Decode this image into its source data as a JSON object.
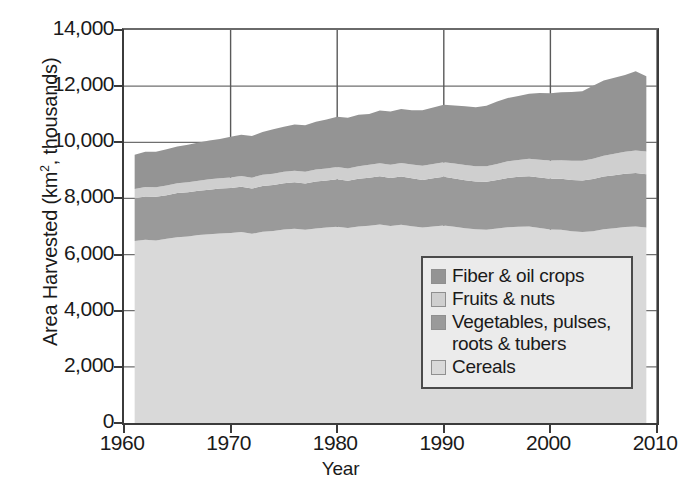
{
  "chart_data": {
    "type": "area",
    "title": "",
    "xlabel": "Year",
    "ylabel": "Area Harvested (km2, thousands)",
    "ylabel_parts": {
      "pre": "Area Harvested (km",
      "sup": "2",
      "post": ", thousands)"
    },
    "xlim": [
      1960,
      2010
    ],
    "ylim": [
      0,
      14000
    ],
    "ytick_labels": [
      "14,000",
      "12,000",
      "10,000",
      "8,000",
      "6,000",
      "4,000",
      "2,000",
      "0"
    ],
    "ytick_values": [
      14000,
      12000,
      10000,
      8000,
      6000,
      4000,
      2000,
      0
    ],
    "xtick_labels": [
      "1960",
      "1970",
      "1980",
      "1990",
      "2000",
      "2010"
    ],
    "xtick_values": [
      1960,
      1970,
      1980,
      1990,
      2000,
      2010
    ],
    "grid": "vertical and horizontal gridlines at major ticks",
    "legend_position": "inside lower-right of plot area",
    "stacking_order_bottom_to_top": [
      "Cereals",
      "Vegetables, pulses, roots & tubers",
      "Fruits & nuts",
      "Fiber & oil crops"
    ],
    "x": [
      1961,
      1962,
      1963,
      1964,
      1965,
      1966,
      1967,
      1968,
      1969,
      1970,
      1971,
      1972,
      1973,
      1974,
      1975,
      1976,
      1977,
      1978,
      1979,
      1980,
      1981,
      1982,
      1983,
      1984,
      1985,
      1986,
      1987,
      1988,
      1989,
      1990,
      1991,
      1992,
      1993,
      1994,
      1995,
      1996,
      1997,
      1998,
      1999,
      2000,
      2001,
      2002,
      2003,
      2004,
      2005,
      2006,
      2007,
      2008,
      2009
    ],
    "series": [
      {
        "name": "Cereals",
        "color": "#d9d9d9",
        "values": [
          6480,
          6530,
          6500,
          6560,
          6620,
          6640,
          6700,
          6720,
          6750,
          6770,
          6800,
          6740,
          6810,
          6840,
          6890,
          6920,
          6880,
          6930,
          6960,
          6990,
          6950,
          7000,
          7030,
          7070,
          7020,
          7060,
          7010,
          6960,
          7000,
          7040,
          6990,
          6940,
          6900,
          6880,
          6930,
          6970,
          6990,
          7000,
          6950,
          6890,
          6880,
          6830,
          6800,
          6830,
          6900,
          6940,
          6980,
          7000,
          6960
        ]
      },
      {
        "name": "Vegetables, pulses, roots & tubers",
        "color": "#9a9a9a",
        "values": [
          1530,
          1540,
          1560,
          1550,
          1570,
          1580,
          1570,
          1590,
          1600,
          1600,
          1620,
          1610,
          1630,
          1640,
          1650,
          1660,
          1650,
          1670,
          1680,
          1690,
          1680,
          1700,
          1710,
          1720,
          1710,
          1720,
          1710,
          1700,
          1720,
          1730,
          1720,
          1710,
          1700,
          1710,
          1730,
          1760,
          1780,
          1790,
          1800,
          1810,
          1820,
          1830,
          1840,
          1860,
          1880,
          1890,
          1900,
          1910,
          1900
        ]
      },
      {
        "name": "Fruits & nuts",
        "color": "#cfcfcf",
        "values": [
          330,
          340,
          340,
          350,
          350,
          360,
          360,
          370,
          370,
          380,
          380,
          390,
          400,
          400,
          410,
          410,
          420,
          430,
          430,
          440,
          440,
          450,
          460,
          460,
          470,
          480,
          490,
          500,
          510,
          520,
          530,
          540,
          550,
          560,
          570,
          590,
          600,
          620,
          630,
          650,
          660,
          680,
          700,
          720,
          740,
          760,
          780,
          800,
          810
        ]
      },
      {
        "name": "Fiber & oil crops",
        "color": "#949494",
        "values": [
          1220,
          1250,
          1260,
          1290,
          1310,
          1330,
          1360,
          1380,
          1400,
          1450,
          1470,
          1480,
          1530,
          1580,
          1600,
          1640,
          1660,
          1700,
          1740,
          1790,
          1800,
          1830,
          1810,
          1880,
          1900,
          1930,
          1930,
          1980,
          2010,
          2050,
          2070,
          2090,
          2100,
          2150,
          2220,
          2260,
          2280,
          2320,
          2380,
          2400,
          2420,
          2450,
          2480,
          2600,
          2680,
          2710,
          2740,
          2820,
          2680
        ]
      }
    ],
    "total_notes": {
      "1961_total": 9560,
      "1970_total": 10200,
      "1990_total": 11340,
      "2009_total": 12350
    }
  },
  "legend": {
    "items": [
      {
        "label": "Fiber & oil crops",
        "color": "#949494"
      },
      {
        "label": "Fruits & nuts",
        "color": "#cfcfcf"
      },
      {
        "label": "Vegetables, pulses,\nroots & tubers",
        "label_line1": "Vegetables, pulses,",
        "label_line2": "roots & tubers",
        "color": "#9a9a9a"
      },
      {
        "label": "Cereals",
        "color": "#d9d9d9"
      }
    ]
  },
  "axes": {
    "y_title_pre": "Area Harvested (km",
    "y_title_sup": "2",
    "y_title_post": ", thousands)",
    "x_title": "Year"
  }
}
